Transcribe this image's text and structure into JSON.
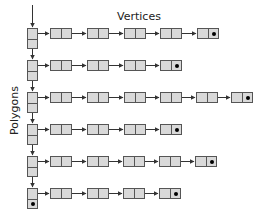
{
  "labels": {
    "vertices": "Vertices",
    "polygons": "Polygons"
  },
  "colors": {
    "node_fill": "#d9d9d9",
    "node_border": "#555555",
    "arrow": "#333333",
    "terminal_dot": "#000000"
  },
  "diagram": {
    "type": "linked-list-of-linked-lists",
    "polygon_column_x": 27,
    "rows": [
      {
        "polygon": 1,
        "y": 28,
        "vertex_x": [
          50,
          87,
          124,
          160,
          197
        ],
        "terminal_vertex": 5
      },
      {
        "polygon": 2,
        "y": 60,
        "vertex_x": [
          50,
          87,
          124,
          160
        ],
        "terminal_vertex": 4
      },
      {
        "polygon": 3,
        "y": 92,
        "vertex_x": [
          50,
          87,
          124,
          160,
          196,
          231
        ],
        "terminal_vertex": 6
      },
      {
        "polygon": 4,
        "y": 124,
        "vertex_x": [
          50,
          87,
          124,
          160
        ],
        "terminal_vertex": 4
      },
      {
        "polygon": 5,
        "y": 156,
        "vertex_x": [
          50,
          87,
          123,
          159,
          195
        ],
        "terminal_vertex": 5
      },
      {
        "polygon": 6,
        "y": 188,
        "vertex_x": [
          50,
          87,
          123,
          159
        ],
        "terminal_vertex": 4,
        "last_polygon": true
      }
    ]
  }
}
